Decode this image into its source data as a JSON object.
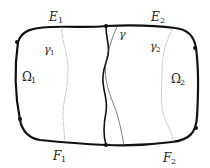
{
  "diagram": {
    "type": "domain-decomposition",
    "colors": {
      "boundary": "#111111",
      "interface": "#111111",
      "gamma": "#444444",
      "dotted": "#888888",
      "background": "#ffffff"
    },
    "labels": {
      "E1": {
        "main": "E",
        "sub": "1"
      },
      "E2": {
        "main": "E",
        "sub": "2"
      },
      "F1": {
        "main": "F",
        "sub": "1"
      },
      "F2": {
        "main": "F",
        "sub": "2"
      },
      "gamma": {
        "main": "γ"
      },
      "gamma1": {
        "main": "γ",
        "sub": "1"
      },
      "gamma2": {
        "main": "γ",
        "sub": "2"
      },
      "Omega1": {
        "main": "Ω",
        "sub": "1"
      },
      "Omega2": {
        "main": "Ω",
        "sub": "2"
      }
    }
  }
}
